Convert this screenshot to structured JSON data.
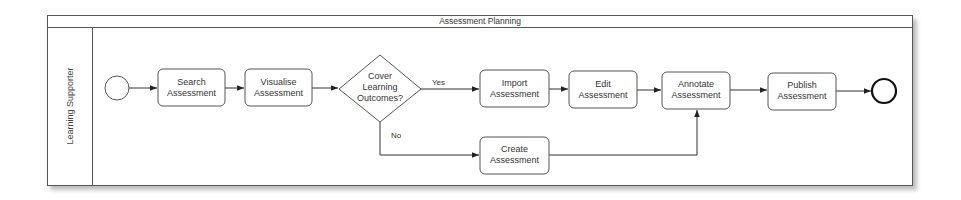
{
  "pool": {
    "title": "Assessment Planning",
    "lane_label": "Learning Supporter"
  },
  "events": {
    "start": {
      "label": "",
      "type": "start-event"
    },
    "end": {
      "label": "",
      "type": "end-event"
    }
  },
  "tasks": {
    "search": {
      "line1": "Search",
      "line2": "Assessment"
    },
    "visualise": {
      "line1": "Visualise",
      "line2": "Assessment"
    },
    "import": {
      "line1": "Import",
      "line2": "Assessment"
    },
    "edit": {
      "line1": "Edit",
      "line2": "Assessment"
    },
    "annotate": {
      "line1": "Annotate",
      "line2": "Assessment"
    },
    "publish": {
      "line1": "Publish",
      "line2": "Assessment"
    },
    "create": {
      "line1": "Create",
      "line2": "Assessment"
    }
  },
  "gateway": {
    "line1": "Cover",
    "line2": "Learning",
    "line3": "Outcomes?"
  },
  "flow_labels": {
    "yes": "Yes",
    "no": "No"
  },
  "colors": {
    "stroke": "#444444",
    "text": "#333333",
    "background": "#ffffff"
  }
}
